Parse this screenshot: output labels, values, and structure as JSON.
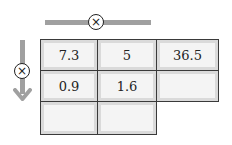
{
  "diagram": {
    "horizontal_operator": {
      "symbol": "⊗",
      "meaning": "multiply",
      "direction": "right"
    },
    "vertical_operator": {
      "symbol": "⊗",
      "meaning": "multiply",
      "direction": "down"
    },
    "grid": {
      "rows": [
        [
          "7.3",
          "5",
          "36.5"
        ],
        [
          "0.9",
          "1.6",
          ""
        ],
        [
          "",
          "",
          null
        ]
      ]
    },
    "colors": {
      "arrow": "#a0a0a0",
      "border": "#3a3a3a",
      "cell_fill": "#f4f4f4",
      "text": "#222222"
    }
  }
}
